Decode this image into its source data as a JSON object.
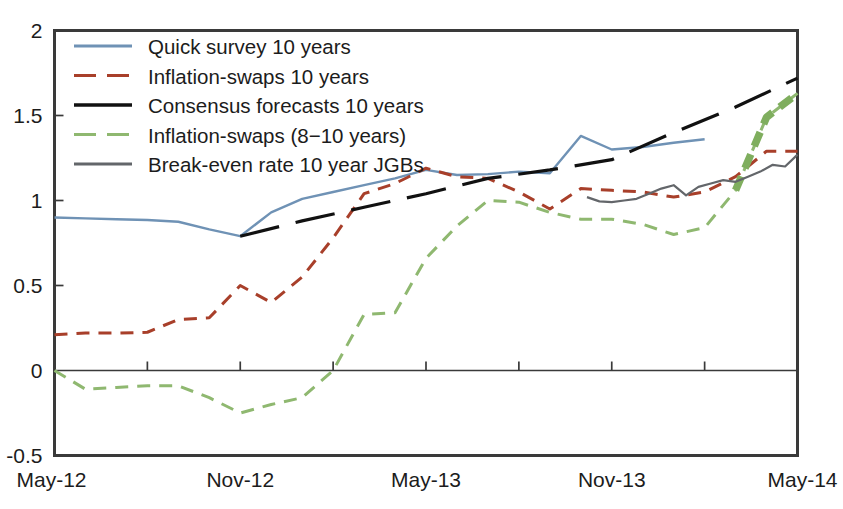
{
  "chart_data": {
    "type": "line",
    "title": "",
    "subtitle": "",
    "xlabel": "",
    "ylabel": "",
    "xlim": [
      0,
      24
    ],
    "ylim": [
      -0.5,
      2
    ],
    "grid": false,
    "legend_position": "top-left",
    "y_ticks": [
      "2",
      "1.5",
      "1",
      "0.5",
      "0",
      "-0.5"
    ],
    "y_tick_values": [
      2,
      1.5,
      1,
      0.5,
      0,
      -0.5
    ],
    "x_ticks": [
      "May-12",
      "Nov-12",
      "May-13",
      "Nov-13",
      "May-14"
    ],
    "x_tick_values": [
      0,
      6,
      12,
      18,
      24
    ],
    "x_minor_tick_values": [
      3,
      6,
      9,
      12,
      15,
      18,
      21,
      24
    ],
    "zero_line": 0,
    "colors": {
      "quick_survey": "#6f92b5",
      "inflation_swaps_10y": "#a83f2a",
      "consensus_forecasts": "#111111",
      "inflation_swaps_8_10y": "#8fb870",
      "break_even_jgb": "#63666a"
    },
    "series": [
      {
        "name": "Quick survey 10 years",
        "style": "solid",
        "color": "#6f92b5",
        "width": 2.4,
        "x": [
          0,
          1,
          2,
          3,
          4,
          5,
          6,
          7,
          8,
          9,
          10,
          11,
          12,
          13,
          14,
          15,
          16,
          17,
          18,
          19,
          20,
          21
        ],
        "values": [
          0.9,
          0.895,
          0.89,
          0.885,
          0.875,
          0.83,
          0.79,
          0.93,
          1.01,
          1.05,
          1.09,
          1.13,
          1.18,
          1.15,
          1.155,
          1.17,
          1.16,
          1.38,
          1.3,
          1.315,
          1.34,
          1.36
        ]
      },
      {
        "name": "Inflation-swaps 10 years",
        "style": "dashed",
        "color": "#a83f2a",
        "width": 3.0,
        "x": [
          0,
          1,
          2,
          3,
          4,
          5,
          6,
          7,
          8,
          9,
          10,
          11,
          12,
          13,
          14,
          15,
          16,
          17,
          18,
          19,
          20,
          21,
          22,
          23,
          24
        ],
        "values": [
          0.21,
          0.22,
          0.22,
          0.225,
          0.3,
          0.31,
          0.5,
          0.4,
          0.55,
          0.78,
          1.04,
          1.1,
          1.19,
          1.14,
          1.13,
          1.05,
          0.95,
          1.07,
          1.06,
          1.05,
          1.02,
          1.05,
          1.14,
          1.29,
          1.29
        ]
      },
      {
        "name": "Consensus forecasts 10 years",
        "style": "long-dashed",
        "color": "#111111",
        "width": 3.2,
        "x": [
          6,
          8,
          10,
          12,
          14,
          16,
          18,
          20,
          22,
          24
        ],
        "values": [
          0.79,
          0.88,
          0.96,
          1.04,
          1.13,
          1.18,
          1.24,
          1.4,
          1.55,
          1.72
        ]
      },
      {
        "name": "Inflation-swaps (8-10 years)",
        "style": "dashed",
        "color": "#8fb870",
        "width": 3.0,
        "x": [
          0,
          1,
          2,
          3,
          4,
          5,
          6,
          7,
          8,
          9,
          10,
          11,
          12,
          13,
          14,
          15,
          16,
          17,
          18,
          19,
          20,
          21,
          22,
          23,
          24
        ],
        "values": [
          0.0,
          -0.11,
          -0.1,
          -0.09,
          -0.09,
          -0.16,
          -0.25,
          -0.2,
          -0.16,
          0.0,
          0.33,
          0.34,
          0.66,
          0.85,
          1.0,
          0.99,
          0.93,
          0.89,
          0.89,
          0.86,
          0.8,
          0.84,
          1.06,
          1.49,
          1.63
        ]
      },
      {
        "name": "Break-even rate 10 year JGBs",
        "style": "solid",
        "color": "#63666a",
        "width": 2.2,
        "x": [
          17.2,
          17.6,
          18.0,
          18.4,
          18.8,
          19.2,
          19.6,
          20.0,
          20.4,
          20.8,
          21.2,
          21.6,
          22.0,
          22.4,
          22.8,
          23.2,
          23.6,
          24.0
        ],
        "values": [
          1.02,
          0.995,
          0.99,
          1.0,
          1.01,
          1.04,
          1.07,
          1.09,
          1.03,
          1.08,
          1.1,
          1.12,
          1.11,
          1.14,
          1.17,
          1.21,
          1.2,
          1.27
        ]
      }
    ],
    "legend": [
      {
        "label": "Quick survey 10 years",
        "color": "#6f92b5",
        "style": "solid"
      },
      {
        "label": "Inflation-swaps 10 years",
        "color": "#a83f2a",
        "style": "dashed"
      },
      {
        "label": "Consensus forecasts 10 years",
        "color": "#111111",
        "style": "solid"
      },
      {
        "label": "Inflation-swaps (8−10 years)",
        "color": "#8fb870",
        "style": "dashed"
      },
      {
        "label": "Break-even rate 10 year JGBs",
        "color": "#63666a",
        "style": "solid"
      }
    ]
  }
}
